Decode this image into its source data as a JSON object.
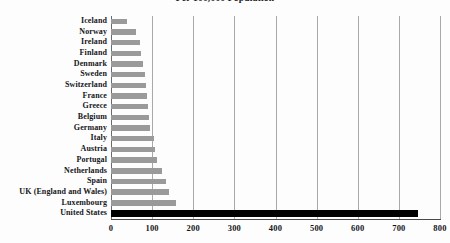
{
  "chart_data": {
    "type": "bar",
    "orientation": "horizontal",
    "title": "Per 100,000 Population",
    "title_line1": "",
    "xlabel": "",
    "ylabel": "",
    "xlim": [
      0,
      800
    ],
    "xticks": [
      0,
      100,
      200,
      300,
      400,
      500,
      600,
      700,
      800
    ],
    "xtick_labels": [
      "0",
      "100",
      "200",
      "300",
      "400",
      "500",
      "600",
      "700",
      "800"
    ],
    "grid": true,
    "legend": "none",
    "categories": [
      "Iceland",
      "Norway",
      "Ireland",
      "Finland",
      "Denmark",
      "Sweden",
      "Switzerland",
      "France",
      "Greece",
      "Belgium",
      "Germany",
      "Italy",
      "Austria",
      "Portugal",
      "Netherlands",
      "Spain",
      "UK (England and Wales)",
      "Luxembourg",
      "United States"
    ],
    "values": [
      38,
      62,
      70,
      73,
      78,
      82,
      84,
      88,
      90,
      93,
      96,
      104,
      107,
      112,
      124,
      133,
      140,
      158,
      747
    ],
    "bar_color": "#9a9a9a",
    "highlight_color": "#000000",
    "highlight_category": "United States"
  }
}
